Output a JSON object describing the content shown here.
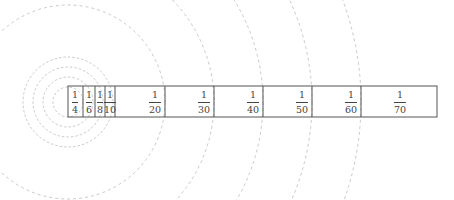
{
  "diagram": {
    "center": [
      68,
      102
    ],
    "small_circle_radii": [
      15,
      25,
      35,
      45
    ],
    "large_arc_radii": [
      97,
      146,
      195,
      244,
      293
    ],
    "box": {
      "left": 68,
      "top": 86,
      "right": 437,
      "bottom": 117
    },
    "dividers": [
      83,
      95,
      105,
      115,
      165,
      214,
      263,
      312,
      361
    ],
    "cells": [
      {
        "num": "1",
        "den": "4",
        "x": 75
      },
      {
        "num": "1",
        "den": "6",
        "x": 89
      },
      {
        "num": "1",
        "den": "8",
        "x": 100
      },
      {
        "num": "1",
        "den": "10",
        "x": 110
      },
      {
        "num": "1",
        "den": "20",
        "x": 155
      },
      {
        "num": "1",
        "den": "30",
        "x": 204
      },
      {
        "num": "1",
        "den": "40",
        "x": 253
      },
      {
        "num": "1",
        "den": "50",
        "x": 302
      },
      {
        "num": "1",
        "den": "60",
        "x": 351
      },
      {
        "num": "1",
        "den": "70",
        "x": 400
      }
    ],
    "colors": {
      "circle": "#bbbbbb",
      "box": "#555555",
      "text": "#444444"
    }
  }
}
